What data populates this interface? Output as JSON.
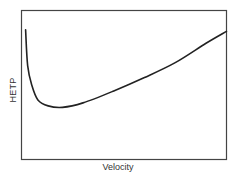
{
  "chart_data": {
    "type": "line",
    "title": "",
    "xlabel": "Velocity",
    "ylabel": "HETP",
    "grid": false,
    "legend": null,
    "x_ticks": [],
    "y_ticks": [],
    "series": [
      {
        "name": "HETP curve",
        "x": [
          0.02,
          0.03,
          0.05,
          0.08,
          0.13,
          0.2,
          0.3,
          0.45,
          0.6,
          0.75,
          0.9,
          1.0
        ],
        "y": [
          0.87,
          0.63,
          0.5,
          0.4,
          0.36,
          0.35,
          0.38,
          0.46,
          0.55,
          0.65,
          0.78,
          0.86
        ]
      }
    ],
    "xlim": [
      0,
      1
    ],
    "ylim": [
      0,
      1
    ]
  },
  "plot": {
    "frame_color": "#444444",
    "line_color": "#222222"
  }
}
